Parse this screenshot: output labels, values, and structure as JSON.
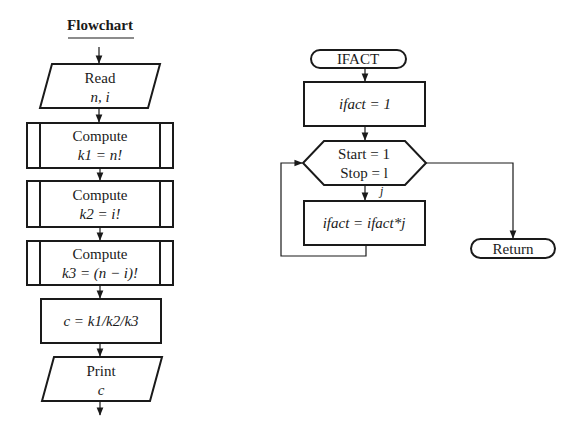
{
  "left_flowchart": {
    "title": "Flowchart",
    "read": {
      "label": "Read",
      "vars": "n, i"
    },
    "compute1": {
      "label": "Compute",
      "expr": "k1 = n!"
    },
    "compute2": {
      "label": "Compute",
      "expr": "k2 = i!"
    },
    "compute3": {
      "label": "Compute",
      "expr": "k3 = (n − i)!"
    },
    "assign": {
      "expr": "c = k1/k2/k3"
    },
    "print": {
      "label": "Print",
      "vars": "c"
    }
  },
  "right_flowchart": {
    "start": "IFACT",
    "init": "ifact = 1",
    "loop": {
      "start": "Start = 1",
      "stop": "Stop = l",
      "index": "j"
    },
    "body": "ifact = ifact*j",
    "end": "Return"
  }
}
